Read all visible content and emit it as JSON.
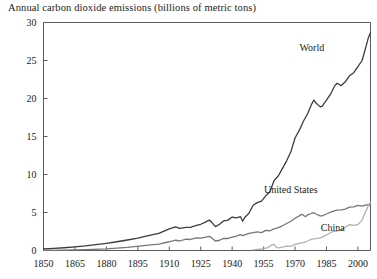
{
  "chart_data": {
    "type": "line",
    "title": "Annual carbon dioxide emissions (billions of metric tons)",
    "xlabel": "",
    "ylabel": "",
    "xlim": [
      1850,
      2006
    ],
    "ylim": [
      0,
      30
    ],
    "xticks": [
      1850,
      1865,
      1880,
      1895,
      1910,
      1925,
      1940,
      1955,
      1970,
      1985,
      2000
    ],
    "xtick_labels": [
      "1850",
      "1865",
      "1880",
      "1895",
      "1910",
      "1925",
      "1940",
      "1955",
      "1970",
      "1985",
      "2000"
    ],
    "yticks": [
      0,
      5,
      10,
      15,
      20,
      25,
      30
    ],
    "ytick_labels": [
      "0",
      "5",
      "10",
      "15",
      "20",
      "25",
      "30"
    ],
    "grid": false,
    "legend_position": "inline-annotations",
    "series": [
      {
        "name": "World",
        "color": "#3c3c3c",
        "label_x": 1978,
        "label_y": 26.2,
        "x": [
          1850,
          1855,
          1860,
          1865,
          1870,
          1875,
          1880,
          1885,
          1890,
          1895,
          1900,
          1905,
          1910,
          1913,
          1915,
          1918,
          1920,
          1923,
          1925,
          1927,
          1929,
          1930,
          1932,
          1934,
          1936,
          1938,
          1940,
          1942,
          1944,
          1945,
          1946,
          1948,
          1950,
          1952,
          1954,
          1956,
          1958,
          1960,
          1962,
          1964,
          1966,
          1968,
          1970,
          1972,
          1974,
          1976,
          1978,
          1979,
          1980,
          1982,
          1983,
          1985,
          1987,
          1989,
          1990,
          1992,
          1994,
          1996,
          1998,
          2000,
          2002,
          2004,
          2005,
          2006
        ],
        "y": [
          0.2,
          0.28,
          0.36,
          0.47,
          0.6,
          0.77,
          0.95,
          1.15,
          1.38,
          1.62,
          1.95,
          2.25,
          2.85,
          3.1,
          2.9,
          3.05,
          3.05,
          3.3,
          3.45,
          3.7,
          4.0,
          3.8,
          3.15,
          3.45,
          3.9,
          4.0,
          4.4,
          4.3,
          4.45,
          3.85,
          4.35,
          4.9,
          5.95,
          6.3,
          6.5,
          7.2,
          7.7,
          9.2,
          9.8,
          10.8,
          11.8,
          13.0,
          14.8,
          15.8,
          17.0,
          18.0,
          19.3,
          19.8,
          19.4,
          18.9,
          19.0,
          19.8,
          20.6,
          21.7,
          22.0,
          21.7,
          22.2,
          23.0,
          23.4,
          24.2,
          25.0,
          27.0,
          28.0,
          28.7
        ]
      },
      {
        "name": "United States",
        "color": "#777777",
        "label_x": 1968,
        "label_y": 7.6,
        "x": [
          1850,
          1860,
          1870,
          1880,
          1890,
          1900,
          1905,
          1910,
          1913,
          1915,
          1918,
          1920,
          1923,
          1925,
          1927,
          1929,
          1930,
          1932,
          1934,
          1936,
          1938,
          1940,
          1942,
          1944,
          1945,
          1946,
          1948,
          1950,
          1952,
          1954,
          1956,
          1958,
          1960,
          1962,
          1964,
          1966,
          1968,
          1970,
          1972,
          1973,
          1974,
          1975,
          1976,
          1978,
          1979,
          1980,
          1982,
          1983,
          1985,
          1987,
          1989,
          1990,
          1992,
          1994,
          1996,
          1998,
          2000,
          2002,
          2004,
          2006
        ],
        "y": [
          0.02,
          0.06,
          0.12,
          0.22,
          0.42,
          0.7,
          0.85,
          1.15,
          1.35,
          1.25,
          1.5,
          1.45,
          1.65,
          1.62,
          1.72,
          1.85,
          1.72,
          1.25,
          1.35,
          1.6,
          1.58,
          1.75,
          1.9,
          2.1,
          1.95,
          2.05,
          2.25,
          2.35,
          2.45,
          2.35,
          2.65,
          2.6,
          2.85,
          3.0,
          3.25,
          3.55,
          3.85,
          4.25,
          4.55,
          4.75,
          4.65,
          4.45,
          4.7,
          4.9,
          4.95,
          4.8,
          4.55,
          4.55,
          4.8,
          5.05,
          5.25,
          5.3,
          5.35,
          5.45,
          5.7,
          5.75,
          5.95,
          5.85,
          6.0,
          5.95
        ]
      },
      {
        "name": "China",
        "color": "#b0b0b0",
        "label_x": 1988,
        "label_y": 2.6,
        "x": [
          1950,
          1952,
          1954,
          1956,
          1957,
          1958,
          1959,
          1960,
          1961,
          1962,
          1963,
          1964,
          1966,
          1968,
          1970,
          1972,
          1974,
          1976,
          1978,
          1980,
          1982,
          1984,
          1986,
          1988,
          1990,
          1992,
          1994,
          1996,
          1998,
          2000,
          2002,
          2003,
          2004,
          2005,
          2006
        ],
        "y": [
          0.08,
          0.14,
          0.2,
          0.3,
          0.38,
          0.55,
          0.75,
          0.8,
          0.45,
          0.35,
          0.38,
          0.45,
          0.58,
          0.55,
          0.8,
          0.95,
          1.05,
          1.25,
          1.5,
          1.55,
          1.65,
          1.9,
          2.2,
          2.5,
          2.55,
          2.7,
          3.05,
          3.4,
          3.3,
          3.4,
          4.0,
          4.7,
          5.3,
          5.9,
          6.4
        ]
      }
    ]
  }
}
